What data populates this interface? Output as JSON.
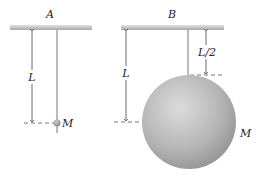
{
  "figure": {
    "panels": [
      {
        "id": "A",
        "title": "A",
        "length_label": "L",
        "mass_label": "M",
        "description": "Point mass M on string of length L"
      },
      {
        "id": "B",
        "title": "B",
        "length_label": "L",
        "string_label": "L/2",
        "mass_label": "M",
        "description": "Large sphere of mass M hung by string of length L/2; center at distance L"
      }
    ]
  }
}
